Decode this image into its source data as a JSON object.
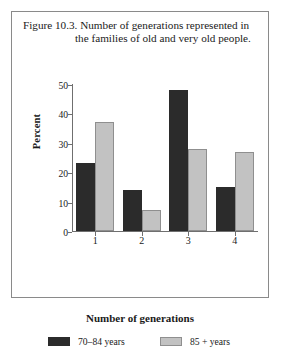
{
  "figure": {
    "caption_lead": "Figure 10.3.",
    "caption_body": " Number of generations represented in the families of old and very old people."
  },
  "chart_data": {
    "type": "bar",
    "title": "Figure 10.3. Number of generations represented in the families of old and very old people.",
    "categories": [
      "1",
      "2",
      "3",
      "4"
    ],
    "series": [
      {
        "name": "70–84 years",
        "color": "#2b2b2b",
        "values": [
          23,
          14,
          48,
          15
        ]
      },
      {
        "name": "85 + years",
        "color": "#c2c2c2",
        "values": [
          37,
          7,
          28,
          27
        ]
      }
    ],
    "xlabel": "Number of generations",
    "ylabel": "Percent",
    "ylim": [
      0,
      50
    ],
    "yticks": [
      0,
      10,
      20,
      30,
      40,
      50
    ],
    "grid": false,
    "legend_position": "bottom"
  }
}
